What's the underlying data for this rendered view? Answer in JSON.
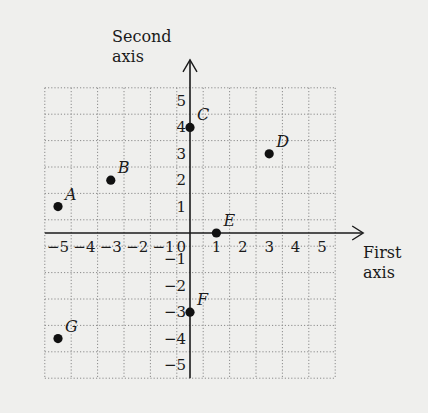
{
  "chart_data": {
    "type": "scatter",
    "title": "",
    "xlabel": "First axis",
    "ylabel": "Second axis",
    "xlabel_lines": [
      "First",
      "axis"
    ],
    "ylabel_lines": [
      "Second",
      "axis"
    ],
    "xlim": [
      -5.5,
      5.5
    ],
    "ylim": [
      -5.5,
      5.5
    ],
    "grid": true,
    "grid_style": "dotted",
    "origin_label": "0",
    "x_ticks": [
      -5,
      -4,
      -3,
      -2,
      -1,
      1,
      2,
      3,
      4,
      5
    ],
    "x_tick_labels": [
      "−5",
      "−4",
      "−3",
      "−2",
      "−1",
      "1",
      "2",
      "3",
      "4",
      "5"
    ],
    "y_ticks": [
      5,
      4,
      3,
      2,
      1,
      -1,
      -2,
      -3,
      -4,
      -5
    ],
    "y_tick_labels": [
      "5",
      "4",
      "3",
      "2",
      "1",
      "−1",
      "−2",
      "−3",
      "−4",
      "−5"
    ],
    "points": [
      {
        "label": "A",
        "x": -5,
        "y": 1
      },
      {
        "label": "B",
        "x": -3,
        "y": 2
      },
      {
        "label": "C",
        "x": 0,
        "y": 4
      },
      {
        "label": "D",
        "x": 3,
        "y": 3
      },
      {
        "label": "E",
        "x": 1,
        "y": 0
      },
      {
        "label": "F",
        "x": 0,
        "y": -3
      },
      {
        "label": "G",
        "x": -5,
        "y": -4
      }
    ],
    "legend": null
  },
  "colors": {
    "background": "#efefed",
    "grid": "#8a8a8a",
    "axis": "#1a1a1a",
    "point": "#111111"
  }
}
